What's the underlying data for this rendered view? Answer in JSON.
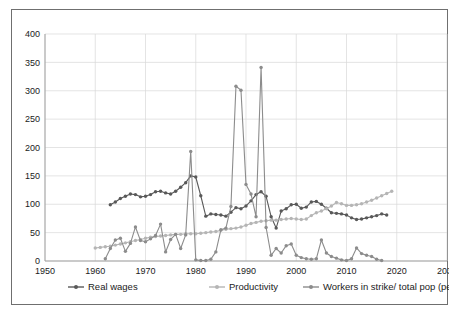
{
  "chart_data": {
    "type": "line",
    "title": "",
    "subtitle": "",
    "xlabel": "",
    "ylabel": "",
    "xlim": [
      1950,
      2030
    ],
    "ylim": [
      0,
      400
    ],
    "x_ticks": [
      1950,
      1960,
      1970,
      1980,
      1990,
      2000,
      2010,
      2020,
      2030
    ],
    "y_ticks": [
      0,
      50,
      100,
      150,
      200,
      250,
      300,
      350,
      400
    ],
    "grid": true,
    "legend_position": "bottom",
    "markers": true,
    "series": [
      {
        "name": "Real wages",
        "color": "#595959",
        "x": [
          1963,
          1964,
          1965,
          1966,
          1967,
          1968,
          1969,
          1970,
          1971,
          1972,
          1973,
          1974,
          1975,
          1976,
          1977,
          1978,
          1979,
          1980,
          1981,
          1982,
          1983,
          1984,
          1985,
          1986,
          1987,
          1988,
          1989,
          1990,
          1991,
          1992,
          1993,
          1994,
          1995,
          1996,
          1997,
          1998,
          1999,
          2000,
          2001,
          2002,
          2003,
          2004,
          2005,
          2006,
          2007,
          2008,
          2009,
          2010,
          2011,
          2012,
          2013,
          2014,
          2015,
          2016,
          2017,
          2018
        ],
        "values": [
          99,
          104,
          110,
          114,
          118,
          117,
          113,
          114,
          117,
          122,
          123,
          120,
          118,
          123,
          130,
          138,
          150,
          148,
          115,
          79,
          83,
          82,
          81,
          79,
          86,
          94,
          92,
          97,
          106,
          117,
          122,
          114,
          78,
          58,
          88,
          92,
          99,
          100,
          93,
          95,
          104,
          105,
          100,
          93,
          85,
          84,
          83,
          81,
          76,
          73,
          74,
          76,
          78,
          80,
          83,
          81
        ]
      },
      {
        "name": "Productivity",
        "color": "#b5b5b5",
        "x": [
          1960,
          1961,
          1962,
          1963,
          1964,
          1965,
          1966,
          1967,
          1968,
          1969,
          1970,
          1971,
          1972,
          1973,
          1974,
          1975,
          1976,
          1977,
          1978,
          1979,
          1980,
          1981,
          1982,
          1983,
          1984,
          1985,
          1986,
          1987,
          1988,
          1989,
          1990,
          1991,
          1992,
          1993,
          1994,
          1995,
          1996,
          1997,
          1998,
          1999,
          2000,
          2001,
          2002,
          2003,
          2004,
          2005,
          2006,
          2007,
          2008,
          2009,
          2010,
          2011,
          2012,
          2013,
          2014,
          2015,
          2016,
          2017,
          2018,
          2019
        ],
        "values": [
          23,
          24,
          25,
          26,
          28,
          30,
          32,
          34,
          36,
          38,
          40,
          42,
          43,
          44,
          45,
          46,
          47,
          47,
          48,
          48,
          48,
          49,
          50,
          51,
          52,
          54,
          56,
          57,
          58,
          60,
          63,
          66,
          68,
          70,
          71,
          72,
          72,
          73,
          74,
          75,
          74,
          73,
          74,
          80,
          85,
          88,
          92,
          97,
          103,
          101,
          98,
          98,
          99,
          101,
          104,
          107,
          111,
          115,
          119,
          123
        ]
      },
      {
        "name": "Workers in strike/ total pop (per million)",
        "color": "#8c8c8c",
        "x": [
          1962,
          1963,
          1964,
          1965,
          1966,
          1967,
          1968,
          1969,
          1970,
          1971,
          1972,
          1973,
          1974,
          1975,
          1976,
          1977,
          1978,
          1979,
          1980,
          1981,
          1982,
          1983,
          1984,
          1985,
          1986,
          1987,
          1988,
          1989,
          1990,
          1991,
          1992,
          1993,
          1994,
          1995,
          1996,
          1997,
          1998,
          1999,
          2000,
          2001,
          2002,
          2003,
          2004,
          2005,
          2006,
          2007,
          2008,
          2009,
          2010,
          2011,
          2012,
          2013,
          2014,
          2015,
          2016,
          2017
        ],
        "values": [
          4,
          22,
          37,
          40,
          17,
          31,
          60,
          36,
          34,
          39,
          45,
          65,
          16,
          38,
          47,
          22,
          46,
          193,
          2,
          1,
          1,
          3,
          16,
          55,
          58,
          96,
          308,
          301,
          135,
          118,
          78,
          341,
          59,
          10,
          22,
          14,
          27,
          30,
          10,
          6,
          4,
          3,
          4,
          37,
          14,
          8,
          5,
          2,
          1,
          4,
          23,
          13,
          10,
          8,
          3,
          1
        ]
      }
    ]
  },
  "legend": {
    "items": [
      {
        "label": "Real wages"
      },
      {
        "label": "Productivity"
      },
      {
        "label": "Workers in strike/ total pop (per million)"
      }
    ]
  },
  "axes": {
    "y_tick_labels": [
      "0",
      "50",
      "100",
      "150",
      "200",
      "250",
      "300",
      "350",
      "400"
    ],
    "x_tick_labels": [
      "1950",
      "1960",
      "1970",
      "1980",
      "1990",
      "2000",
      "2010",
      "2020",
      "2030"
    ]
  }
}
